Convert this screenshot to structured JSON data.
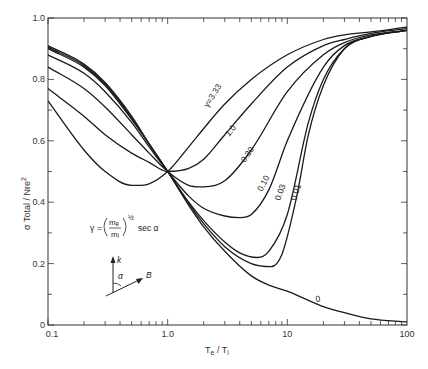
{
  "chart_data": {
    "type": "line",
    "title": "",
    "xlabel": "Te / Ti",
    "ylabel": "σ Total / Nre²",
    "xscale": "log",
    "xlim": [
      0.1,
      100
    ],
    "ylim": [
      0,
      1.0
    ],
    "grid": false,
    "x_tick_labels": [
      "0.1",
      "1.0",
      "10",
      "100"
    ],
    "y_tick_labels": [
      "0",
      "0.2",
      "0.4",
      "0.6",
      "0.8",
      "1.0"
    ],
    "annotations": {
      "gamma_formula": "γ = (mₑ/mᵢ)^½ sec α",
      "formula_prefix": "γ",
      "formula_num": "mₑ",
      "formula_den": "mᵢ",
      "formula_exp": "½",
      "formula_suffix": "sec α",
      "vector_k": "k",
      "vector_B": "B",
      "angle": "α"
    },
    "series": [
      {
        "name": "γ = 3.33",
        "label": "γ=3.33",
        "x": [
          0.1,
          0.2,
          0.3,
          0.5,
          0.7,
          1.0,
          1.5,
          2,
          3,
          5,
          10,
          20,
          30,
          50,
          100
        ],
        "values": [
          0.73,
          0.57,
          0.5,
          0.455,
          0.46,
          0.5,
          0.58,
          0.64,
          0.72,
          0.8,
          0.88,
          0.93,
          0.945,
          0.955,
          0.97
        ]
      },
      {
        "name": "γ = 1.0",
        "label": "1.0",
        "x": [
          0.1,
          0.2,
          0.3,
          0.5,
          0.7,
          1.0,
          1.5,
          2,
          3,
          5,
          10,
          20,
          30,
          50,
          100
        ],
        "values": [
          0.77,
          0.68,
          0.62,
          0.56,
          0.53,
          0.5,
          0.51,
          0.54,
          0.62,
          0.72,
          0.84,
          0.91,
          0.93,
          0.95,
          0.965
        ]
      },
      {
        "name": "γ = 0.30",
        "label": "0.30",
        "x": [
          0.1,
          0.2,
          0.3,
          0.5,
          0.7,
          1.0,
          1.5,
          2,
          3,
          5,
          10,
          20,
          30,
          50,
          100
        ],
        "values": [
          0.84,
          0.77,
          0.71,
          0.62,
          0.56,
          0.5,
          0.455,
          0.45,
          0.47,
          0.57,
          0.76,
          0.88,
          0.92,
          0.945,
          0.96
        ]
      },
      {
        "name": "γ = 0.10",
        "label": "0.10",
        "x": [
          0.1,
          0.2,
          0.3,
          0.5,
          0.7,
          1.0,
          1.5,
          2,
          3,
          4,
          5,
          7,
          10,
          20,
          30,
          50,
          100
        ],
        "values": [
          0.88,
          0.82,
          0.76,
          0.66,
          0.58,
          0.5,
          0.42,
          0.38,
          0.355,
          0.35,
          0.36,
          0.44,
          0.6,
          0.84,
          0.91,
          0.94,
          0.96
        ]
      },
      {
        "name": "γ = 0.03",
        "label": "0.03",
        "x": [
          0.1,
          0.2,
          0.3,
          0.5,
          0.7,
          1.0,
          1.5,
          2,
          3,
          4,
          5.6,
          7,
          10,
          15,
          20,
          30,
          50,
          100
        ],
        "values": [
          0.9,
          0.84,
          0.78,
          0.67,
          0.59,
          0.5,
          0.4,
          0.34,
          0.27,
          0.235,
          0.22,
          0.24,
          0.36,
          0.66,
          0.8,
          0.9,
          0.94,
          0.96
        ]
      },
      {
        "name": "γ = 0.01",
        "label": "0.01",
        "x": [
          0.1,
          0.2,
          0.3,
          0.5,
          0.7,
          1.0,
          1.5,
          2,
          3,
          5,
          7.3,
          9,
          12,
          15,
          20,
          30,
          50,
          100
        ],
        "values": [
          0.905,
          0.845,
          0.785,
          0.675,
          0.59,
          0.5,
          0.395,
          0.33,
          0.255,
          0.2,
          0.19,
          0.23,
          0.42,
          0.62,
          0.78,
          0.9,
          0.94,
          0.96
        ]
      },
      {
        "name": "γ = 0",
        "label": "0",
        "x": [
          0.1,
          0.2,
          0.3,
          0.5,
          0.7,
          1.0,
          1.5,
          2,
          3,
          5,
          7,
          10,
          15,
          20,
          30,
          50,
          100
        ],
        "values": [
          0.91,
          0.85,
          0.79,
          0.68,
          0.59,
          0.5,
          0.39,
          0.32,
          0.24,
          0.16,
          0.13,
          0.11,
          0.08,
          0.06,
          0.04,
          0.02,
          0.01
        ]
      }
    ]
  }
}
